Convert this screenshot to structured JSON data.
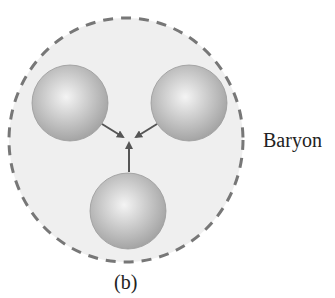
{
  "diagram": {
    "label": "Baryon",
    "caption": "(b)",
    "boundary": {
      "shape": "dashed-ellipse",
      "cx": 126,
      "cy": 140,
      "rx": 117,
      "ry": 122,
      "fill": "#eeeeee",
      "stroke": "#777777"
    },
    "quarks": [
      {
        "name": "quark-top-left",
        "cx": 70,
        "cy": 103,
        "r": 38
      },
      {
        "name": "quark-top-right",
        "cx": 189,
        "cy": 103,
        "r": 38
      },
      {
        "name": "quark-bottom",
        "cx": 128,
        "cy": 211,
        "r": 38
      }
    ],
    "quark_colors": {
      "highlight": "#f2f2f2",
      "mid": "#c4c4c4",
      "edge": "#9e9e9e"
    },
    "arrows": [
      {
        "name": "arrow-from-top-left",
        "x1": 102,
        "y1": 124,
        "x2": 123,
        "y2": 137
      },
      {
        "name": "arrow-from-top-right",
        "x1": 157,
        "y1": 124,
        "x2": 136,
        "y2": 137
      },
      {
        "name": "arrow-from-bottom",
        "x1": 129,
        "y1": 172,
        "x2": 129,
        "y2": 143
      }
    ],
    "arrow_color": "#555555"
  }
}
